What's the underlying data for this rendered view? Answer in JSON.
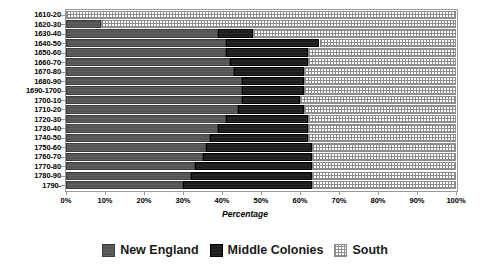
{
  "chart_data": {
    "type": "bar",
    "orientation": "horizontal",
    "stacked": true,
    "stack_mode": "percent",
    "title": "",
    "xlabel": "Percentage",
    "ylabel": "",
    "xlim": [
      0,
      100
    ],
    "xticks": [
      "0%",
      "10%",
      "20%",
      "30%",
      "40%",
      "50%",
      "60%",
      "70%",
      "80%",
      "90%",
      "100%"
    ],
    "grid": false,
    "legend_position": "bottom",
    "categories": [
      "1610-20",
      "1620-30",
      "1630-40",
      "1640-50",
      "1650-60",
      "1660-70",
      "1670-80",
      "1680-90",
      "1690-1700",
      "1700-10",
      "1710-20",
      "1720-30",
      "1730-40",
      "1740-50",
      "1750-60",
      "1760-70",
      "1770-80",
      "1780-90",
      "1790-"
    ],
    "series": [
      {
        "name": "New England",
        "color": "#555555",
        "pattern": "solid-dark-gray",
        "values": [
          0,
          9,
          39,
          41,
          41,
          42,
          43,
          45,
          45,
          45,
          44,
          41,
          39,
          37,
          36,
          35,
          33,
          32,
          30
        ]
      },
      {
        "name": "Middle Colonies",
        "color": "#1c1c1c",
        "pattern": "solid-black",
        "values": [
          0,
          0,
          9,
          24,
          21,
          20,
          18,
          16,
          16,
          15,
          17,
          21,
          23,
          25,
          27,
          28,
          30,
          31,
          33
        ]
      },
      {
        "name": "South",
        "color": "#ffffff",
        "pattern": "cross-hatch-grid",
        "values": [
          100,
          91,
          52,
          35,
          38,
          38,
          39,
          39,
          39,
          40,
          39,
          38,
          38,
          38,
          37,
          37,
          37,
          37,
          37
        ]
      }
    ]
  },
  "legend": {
    "items": [
      {
        "label": "New England"
      },
      {
        "label": "Middle Colonies"
      },
      {
        "label": "South"
      }
    ]
  },
  "axis": {
    "x_title": "Percentage"
  }
}
